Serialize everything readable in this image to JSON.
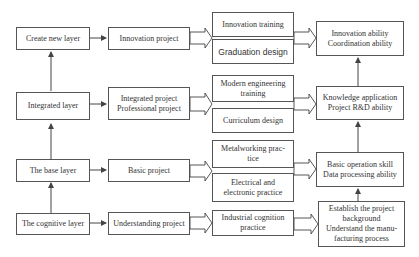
{
  "layers": [
    {
      "id": "create",
      "label": "Create new layer"
    },
    {
      "id": "integrated",
      "label": "Integrated layer"
    },
    {
      "id": "base",
      "label": "The base layer"
    },
    {
      "id": "cognitive",
      "label": "The cognitive layer"
    }
  ],
  "projects": [
    {
      "label": "Innovation project"
    },
    {
      "label": "Integrated project\nProfessional project"
    },
    {
      "label": "Basic project"
    },
    {
      "label": "Understanding project"
    }
  ],
  "practices": [
    {
      "label": "Innovation training"
    },
    {
      "label": "Graduation design"
    },
    {
      "label": "Modern engineering\ntraining"
    },
    {
      "label": "Curriculum design"
    },
    {
      "label": "Metalworking prac-\ntice"
    },
    {
      "label": "Electrical and\nelectronic practice"
    },
    {
      "label": "Industrial cognition\npractice"
    }
  ],
  "abilities": [
    {
      "label": "Innovation ability\nCoordination ability"
    },
    {
      "label": "Knowledge application\nProject R&D ability"
    },
    {
      "label": "Basic operation skill\nData processing ability"
    },
    {
      "label": "Establish the project\nbackground\nUnderstand the manu-\nfacturing process"
    }
  ],
  "colors": {
    "line": "#555555",
    "background": "#ffffff",
    "text": "#333333"
  }
}
